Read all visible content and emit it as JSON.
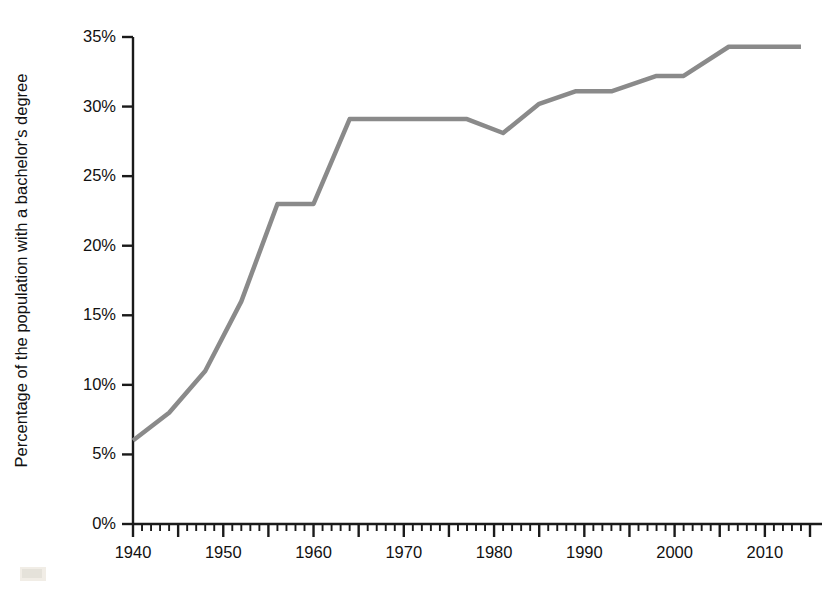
{
  "chart_data": {
    "type": "line",
    "title": "",
    "xlabel": "",
    "ylabel": "Percentage of the population with a bachelor's degree",
    "xlim": [
      1940,
      2015
    ],
    "ylim": [
      0,
      35
    ],
    "grid": false,
    "legend": null,
    "axis_color": "#1a1a1a",
    "line_color": "#8a8a8a",
    "line_width": 4.5,
    "y_ticks": [
      0,
      5,
      10,
      15,
      20,
      25,
      30,
      35
    ],
    "y_tick_labels": [
      "0%",
      "5%",
      "10%",
      "15%",
      "20%",
      "25%",
      "30%",
      "35%"
    ],
    "x_ticks": [
      1940,
      1950,
      1960,
      1970,
      1980,
      1990,
      2000,
      2010
    ],
    "x_tick_labels": [
      "1940",
      "1950",
      "1960",
      "1970",
      "1980",
      "1990",
      "2000",
      "2010"
    ],
    "x_minor_tick_step": 1,
    "x_major_tick_step": 5,
    "x": [
      1940,
      1944,
      1948,
      1952,
      1956,
      1960,
      1964,
      1977,
      1981,
      1985,
      1989,
      1993,
      1998,
      2001,
      2006,
      2014
    ],
    "values": [
      6.0,
      8.0,
      11.0,
      16.0,
      23.0,
      23.0,
      29.1,
      29.1,
      28.1,
      30.2,
      31.1,
      31.1,
      32.2,
      32.2,
      34.3,
      34.3
    ],
    "series": [
      {
        "name": "Percentage of the population with a bachelor's degree",
        "values": [
          6.0,
          8.0,
          11.0,
          16.0,
          23.0,
          23.0,
          29.1,
          29.1,
          28.1,
          30.2,
          31.1,
          31.1,
          32.2,
          32.2,
          34.3,
          34.3
        ]
      }
    ]
  }
}
